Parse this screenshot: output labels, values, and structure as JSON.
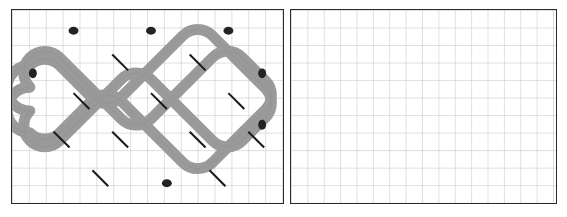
{
  "figure": {
    "kind": "knot-diagram",
    "background_color": "#ffffff",
    "panel_border_color": "#2b2b2b",
    "grid_line_color": "#b9b9bd",
    "grid_line_color_minor": "#dcdce0",
    "strand_color": "#9a9a9a",
    "strand_edge_color": "#8c8c8c",
    "crossing_break_color": "#1c1c1c",
    "apex_marker_color": "#232323"
  },
  "panels": [
    {
      "id": "left",
      "name": "knot-panel",
      "label": "",
      "grid": {
        "columns": 16,
        "rows": 11,
        "cell_px": 17,
        "visible": true
      },
      "has_knot": true
    },
    {
      "id": "right",
      "name": "empty-grid-panel",
      "label": "",
      "grid": {
        "columns": 16,
        "rows": 11,
        "cell_px": 16.5,
        "visible": true
      },
      "has_knot": false
    }
  ],
  "knot": {
    "strand_width_px": 11,
    "crossings": 12,
    "apex_markers": 8,
    "lobes_top": 3,
    "lobes_bottom": 2,
    "lobes_side": 2,
    "style": "interlaced over-under alternating",
    "unit": 39,
    "origin_x": 18,
    "origin_y": 14,
    "apex_points": [
      [
        78,
        16
      ],
      [
        156,
        16
      ],
      [
        234,
        16
      ],
      [
        16,
        78
      ],
      [
        272,
        78
      ],
      [
        55,
        176
      ],
      [
        156,
        186
      ],
      [
        256,
        176
      ]
    ],
    "crossing_points": [
      [
        117,
        55
      ],
      [
        195,
        55
      ],
      [
        78,
        94
      ],
      [
        156,
        94
      ],
      [
        234,
        94
      ],
      [
        117,
        133
      ],
      [
        195,
        133
      ],
      [
        58,
        133
      ],
      [
        254,
        133
      ],
      [
        97,
        172
      ],
      [
        215,
        172
      ],
      [
        156,
        55
      ]
    ]
  }
}
